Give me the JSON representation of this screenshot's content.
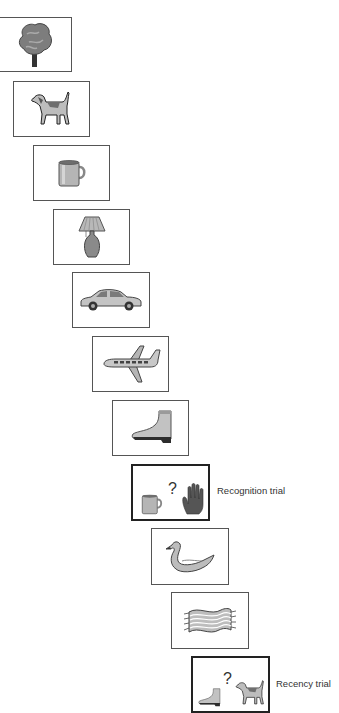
{
  "diagram": {
    "type": "memory-trial-sequence",
    "items": [
      {
        "index": 1,
        "name": "tree",
        "trial": false
      },
      {
        "index": 2,
        "name": "dog",
        "trial": false
      },
      {
        "index": 3,
        "name": "mug",
        "trial": false
      },
      {
        "index": 4,
        "name": "lamp",
        "trial": false
      },
      {
        "index": 5,
        "name": "car",
        "trial": false
      },
      {
        "index": 6,
        "name": "airplane",
        "trial": false
      },
      {
        "index": 7,
        "name": "boot",
        "trial": false
      },
      {
        "index": 8,
        "name": "recognition-trial",
        "trial": true,
        "left": "mug",
        "symbol": "?",
        "right": "hand",
        "label": "Recognition trial"
      },
      {
        "index": 9,
        "name": "swan",
        "trial": false
      },
      {
        "index": 10,
        "name": "scarf",
        "trial": false
      },
      {
        "index": 11,
        "name": "recency-trial",
        "trial": true,
        "left": "boot",
        "symbol": "?",
        "right": "dog",
        "label": "Recency trial"
      }
    ]
  },
  "labels": {
    "recognition": "Recognition trial",
    "recency": "Recency trial",
    "question": "?"
  }
}
